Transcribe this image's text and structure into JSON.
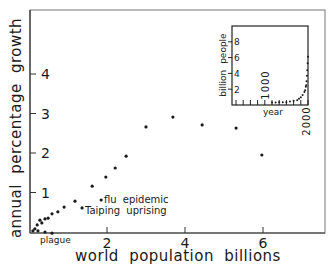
{
  "chart_data": {
    "type": "scatter",
    "title": "",
    "xlabel": "world population billions",
    "ylabel": "annual percentage growth",
    "xlim": [
      0,
      7.5
    ],
    "ylim": [
      0,
      5.6
    ],
    "grid": false,
    "x_ticks": [
      2,
      4,
      6
    ],
    "y_ticks": [
      1,
      2,
      3,
      4
    ],
    "x_tick_labels": [
      "2",
      "4",
      "6"
    ],
    "y_tick_labels": [
      "1",
      "2",
      "3",
      "4"
    ],
    "series": [
      {
        "name": "growth vs population",
        "points": [
          {
            "x": 0.1,
            "y": 0.03
          },
          {
            "x": 0.15,
            "y": 0.08
          },
          {
            "x": 0.21,
            "y": 0.18
          },
          {
            "x": 0.23,
            "y": 0.03
          },
          {
            "x": 0.28,
            "y": 0.3
          },
          {
            "x": 0.33,
            "y": 0.23
          },
          {
            "x": 0.41,
            "y": 0.33
          },
          {
            "x": 0.41,
            "y": 0.0
          },
          {
            "x": 0.49,
            "y": 0.35
          },
          {
            "x": 0.59,
            "y": 0.46
          },
          {
            "x": 0.59,
            "y": -0.03
          },
          {
            "x": 0.74,
            "y": 0.51
          },
          {
            "x": 0.9,
            "y": 0.63
          },
          {
            "x": 1.18,
            "y": 0.78
          },
          {
            "x": 1.36,
            "y": 0.61
          },
          {
            "x": 1.62,
            "y": 1.16
          },
          {
            "x": 1.85,
            "y": 0.81
          },
          {
            "x": 1.97,
            "y": 1.39
          },
          {
            "x": 2.21,
            "y": 1.62
          },
          {
            "x": 2.49,
            "y": 1.92
          },
          {
            "x": 3.0,
            "y": 2.66
          },
          {
            "x": 3.69,
            "y": 2.91
          },
          {
            "x": 4.44,
            "y": 2.71
          },
          {
            "x": 5.31,
            "y": 2.63
          },
          {
            "x": 5.97,
            "y": 1.95
          }
        ]
      }
    ],
    "annotations": [
      {
        "text": "plague",
        "x": 0.41,
        "y": 0.0
      },
      {
        "text": "flu epidemic",
        "x": 1.85,
        "y": 0.81
      },
      {
        "text": "Taiping uprising",
        "x": 1.36,
        "y": 0.61
      }
    ],
    "inset": {
      "type": "line",
      "xlabel": "year",
      "ylabel": "billion people",
      "y_ticks": [
        2,
        4,
        6,
        8
      ],
      "y_tick_labels": [
        "2",
        "4",
        "6",
        "8"
      ],
      "x_tick_labels": [
        "1000",
        "2000"
      ],
      "x_ticks": [
        1000,
        2000
      ],
      "xlim": [
        0,
        2000
      ],
      "ylim": [
        0,
        10
      ],
      "points": [
        {
          "x": 1000,
          "y": 0.31
        },
        {
          "x": 1100,
          "y": 0.32
        },
        {
          "x": 1200,
          "y": 0.36
        },
        {
          "x": 1300,
          "y": 0.36
        },
        {
          "x": 1400,
          "y": 0.35
        },
        {
          "x": 1500,
          "y": 0.43
        },
        {
          "x": 1600,
          "y": 0.55
        },
        {
          "x": 1700,
          "y": 0.6
        },
        {
          "x": 1750,
          "y": 0.79
        },
        {
          "x": 1800,
          "y": 0.98
        },
        {
          "x": 1850,
          "y": 1.26
        },
        {
          "x": 1900,
          "y": 1.65
        },
        {
          "x": 1920,
          "y": 1.86
        },
        {
          "x": 1940,
          "y": 2.3
        },
        {
          "x": 1950,
          "y": 2.5
        },
        {
          "x": 1960,
          "y": 3.0
        },
        {
          "x": 1970,
          "y": 3.7
        },
        {
          "x": 1980,
          "y": 4.4
        },
        {
          "x": 1990,
          "y": 5.3
        },
        {
          "x": 2000,
          "y": 6.1
        }
      ]
    }
  },
  "labels": {
    "xlabel": "world population billions",
    "ylabel": "annual percentage growth",
    "x_ticks": [
      "2",
      "4",
      "6"
    ],
    "y_ticks": [
      "1",
      "2",
      "3",
      "4"
    ],
    "annotation_plague": "plague",
    "annotation_flu": "flu epidemic",
    "annotation_taiping": "Taiping uprising",
    "inset_xlabel": "year",
    "inset_ylabel": "billion people",
    "inset_y_ticks": [
      "2",
      "4",
      "6",
      "8"
    ],
    "inset_x_tick_1000": "1000",
    "inset_x_tick_2000": "2000"
  },
  "colors": {
    "ink": "#1a1a1a",
    "frame": "#555555",
    "background": "#ffffff"
  }
}
